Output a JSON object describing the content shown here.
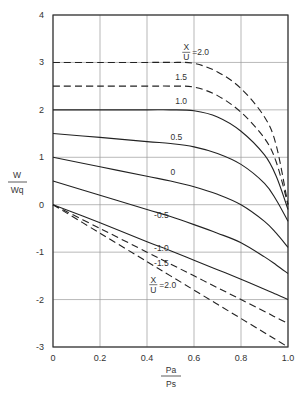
{
  "chart_data": {
    "type": "line",
    "title": "",
    "xlabel": "Pa/Ps",
    "ylabel": "W/Wq",
    "xlabel_parts": {
      "num": "Pa",
      "den": "Ps"
    },
    "ylabel_parts": {
      "num": "W",
      "den": "Wq"
    },
    "xlim": [
      0,
      1.0
    ],
    "ylim": [
      -3,
      4
    ],
    "grid": true,
    "x_ticks": [
      "0",
      "0.2",
      "0.4",
      "0.6",
      "0.8",
      "1.0"
    ],
    "y_ticks": [
      "4",
      "3",
      "2",
      "1",
      "0",
      "-1",
      "-2",
      "-3"
    ],
    "x": [
      0,
      0.2,
      0.4,
      0.5,
      0.6,
      0.7,
      0.8,
      0.9,
      0.95,
      1.0
    ],
    "series": [
      {
        "name": "X/U = 2.0",
        "style": "dashed",
        "values": [
          3.0,
          3.0,
          3.0,
          3.0,
          2.98,
          2.8,
          2.45,
          1.85,
          1.25,
          0.0
        ]
      },
      {
        "name": "1.5",
        "style": "dashed",
        "values": [
          2.5,
          2.5,
          2.5,
          2.5,
          2.48,
          2.3,
          1.95,
          1.4,
          0.9,
          0.0
        ]
      },
      {
        "name": "1.0",
        "style": "solid",
        "values": [
          2.0,
          2.0,
          2.0,
          2.0,
          1.98,
          1.85,
          1.55,
          1.05,
          0.6,
          -0.1
        ]
      },
      {
        "name": "0.5",
        "style": "solid",
        "values": [
          1.5,
          1.42,
          1.33,
          1.29,
          1.22,
          1.08,
          0.85,
          0.45,
          0.1,
          -0.35
        ]
      },
      {
        "name": "0",
        "style": "solid",
        "values": [
          1.0,
          0.8,
          0.6,
          0.5,
          0.38,
          0.22,
          0.0,
          -0.35,
          -0.6,
          -0.9
        ]
      },
      {
        "name": "-0.5",
        "style": "solid",
        "values": [
          0.5,
          0.2,
          -0.1,
          -0.25,
          -0.42,
          -0.6,
          -0.8,
          -1.1,
          -1.27,
          -1.45
        ]
      },
      {
        "name": "-1.0",
        "style": "solid",
        "values": [
          0.0,
          -0.38,
          -0.78,
          -0.97,
          -1.17,
          -1.37,
          -1.57,
          -1.78,
          -1.89,
          -2.0
        ]
      },
      {
        "name": "-1.5",
        "style": "dashed",
        "values": [
          0.0,
          -0.5,
          -1.0,
          -1.25,
          -1.5,
          -1.75,
          -2.0,
          -2.25,
          -2.38,
          -2.5
        ]
      },
      {
        "name": "X/U = 2.0 (neg)",
        "style": "dashed",
        "values": [
          0.0,
          -0.6,
          -1.2,
          -1.5,
          -1.8,
          -2.1,
          -2.4,
          -2.7,
          -2.85,
          -3.0
        ]
      }
    ],
    "annotations": [
      {
        "text_num": "X",
        "text_den": "U",
        "text_val": "=2.0",
        "at": [
          0.55,
          3.15
        ]
      },
      {
        "text": "1.5",
        "at": [
          0.52,
          2.62
        ]
      },
      {
        "text": "1.0",
        "at": [
          0.52,
          2.12
        ]
      },
      {
        "text": "0.5",
        "at": [
          0.5,
          1.37
        ]
      },
      {
        "text": "0",
        "at": [
          0.5,
          0.62
        ]
      },
      {
        "text": "-0.5",
        "at": [
          0.43,
          -0.27
        ]
      },
      {
        "text": "-1.0",
        "at": [
          0.43,
          -0.98
        ]
      },
      {
        "text": "-1.5",
        "at": [
          0.43,
          -1.3
        ]
      },
      {
        "text_num": "X",
        "text_den": "U",
        "text_val": "=2.0",
        "at": [
          0.41,
          -1.75
        ]
      }
    ]
  }
}
